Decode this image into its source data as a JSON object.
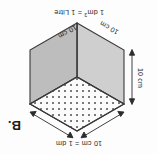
{
  "figure": {
    "panel_label": "B.",
    "caption_top": "10 cm = 1 dm",
    "caption_bottom_prefix": "1 dm",
    "caption_bottom_exponent": "3",
    "caption_bottom_suffix": " = 1 Litre",
    "orientation_note": "rotated-180",
    "dimensions": {
      "height_label": "10 cm",
      "depth_left_label": "10 cm",
      "depth_right_label": "10 cm"
    },
    "colors": {
      "outline": "#3a3a3a",
      "face_top_fill": "#fbfbfb",
      "face_left_fill": "#cfcfcf",
      "face_right_fill": "#bdbdbd",
      "dot_color": "#5a5a5a",
      "text": "#232323",
      "background": "#fdfdfd"
    },
    "shape": {
      "type": "isometric-cube",
      "top_face_pattern": "dotted-grid",
      "dot_grid_rows": 10,
      "dot_grid_cols": 10
    }
  }
}
